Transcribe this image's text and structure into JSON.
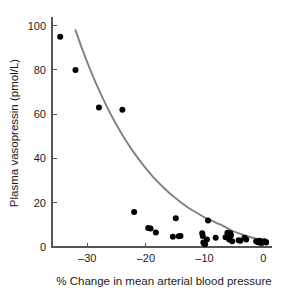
{
  "chart_data": {
    "type": "scatter",
    "title": "",
    "xlabel": "% Change in mean arterial blood pressure",
    "ylabel": "Plasma vasopressin (pmol/L)",
    "xlim": [
      -36,
      1.5
    ],
    "ylim": [
      0,
      103
    ],
    "xticks": [
      -30,
      -20,
      -10,
      0
    ],
    "xtick_labels": [
      "–30",
      "–20",
      "–10",
      "0"
    ],
    "yticks": [
      0,
      20,
      40,
      60,
      80,
      100
    ],
    "ytick_labels": [
      "0",
      "20",
      "40",
      "60",
      "80",
      "100"
    ],
    "grid": false,
    "legend": false,
    "marker_color": "#000000",
    "marker_size": 3.0,
    "series": [
      {
        "name": "Plasma vasopressin vs blood pressure change",
        "type": "scatter",
        "points": [
          [
            -34.6,
            95.0
          ],
          [
            -32.0,
            80.0
          ],
          [
            -28.0,
            63.0
          ],
          [
            -24.0,
            62.0
          ],
          [
            -22.0,
            15.8
          ],
          [
            -19.6,
            8.6
          ],
          [
            -19.2,
            8.4
          ],
          [
            -18.3,
            6.6
          ],
          [
            -15.4,
            4.6
          ],
          [
            -14.9,
            13.0
          ],
          [
            -14.4,
            4.8
          ],
          [
            -14.1,
            5.0
          ],
          [
            -10.4,
            6.2
          ],
          [
            -10.3,
            5.0
          ],
          [
            -10.2,
            2.0
          ],
          [
            -10.1,
            1.6
          ],
          [
            -9.9,
            1.2
          ],
          [
            -9.6,
            3.4
          ],
          [
            -9.4,
            12.0
          ],
          [
            -8.1,
            4.2
          ],
          [
            -6.4,
            4.4
          ],
          [
            -6.1,
            6.4
          ],
          [
            -6.0,
            5.6
          ],
          [
            -5.9,
            4.8
          ],
          [
            -5.8,
            3.4
          ],
          [
            -5.6,
            6.2
          ],
          [
            -5.5,
            5.2
          ],
          [
            -5.3,
            2.6
          ],
          [
            -4.2,
            3.0
          ],
          [
            -3.9,
            2.8
          ],
          [
            -3.2,
            4.2
          ],
          [
            -2.9,
            3.4
          ],
          [
            -1.2,
            2.6
          ],
          [
            -0.9,
            2.2
          ],
          [
            -0.6,
            2.8
          ],
          [
            -0.4,
            1.8
          ],
          [
            -0.2,
            2.4
          ],
          [
            0.2,
            2.6
          ],
          [
            0.5,
            2.0
          ]
        ]
      },
      {
        "name": "exponential fit curve",
        "type": "line",
        "color": "#808080",
        "points": [
          [
            -32.0,
            98.0
          ],
          [
            -31.0,
            90.5
          ],
          [
            -30.0,
            83.5
          ],
          [
            -29.0,
            77.0
          ],
          [
            -28.0,
            71.0
          ],
          [
            -27.0,
            65.3
          ],
          [
            -26.0,
            60.0
          ],
          [
            -25.0,
            55.2
          ],
          [
            -24.0,
            50.6
          ],
          [
            -23.0,
            46.4
          ],
          [
            -22.0,
            42.5
          ],
          [
            -21.0,
            38.9
          ],
          [
            -20.0,
            35.5
          ],
          [
            -19.0,
            32.4
          ],
          [
            -18.0,
            29.5
          ],
          [
            -17.0,
            26.9
          ],
          [
            -16.0,
            24.4
          ],
          [
            -15.0,
            22.2
          ],
          [
            -14.0,
            20.1
          ],
          [
            -13.0,
            18.2
          ],
          [
            -12.0,
            16.5
          ],
          [
            -11.0,
            14.9
          ],
          [
            -10.0,
            13.4
          ],
          [
            -9.0,
            12.1
          ],
          [
            -8.0,
            10.9
          ],
          [
            -7.0,
            9.8
          ],
          [
            -6.0,
            8.3
          ],
          [
            -5.0,
            7.0
          ],
          [
            -4.0,
            6.0
          ],
          [
            -3.0,
            5.1
          ],
          [
            -2.0,
            4.3
          ],
          [
            -1.0,
            3.7
          ],
          [
            0.0,
            3.2
          ],
          [
            0.8,
            3.0
          ]
        ]
      }
    ]
  }
}
